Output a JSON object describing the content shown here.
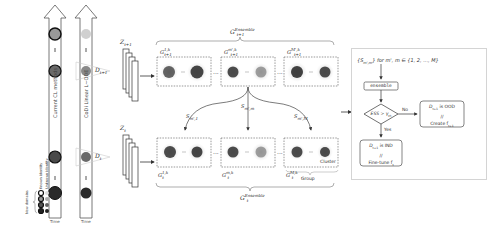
{
  "timeline_left": {
    "label": "Current CL methods",
    "axis_label": "Time",
    "dots": [
      "...",
      "..."
    ]
  },
  "timeline_right": {
    "label": "CoDi Linear L~ODE",
    "axis_label": "Time",
    "dots": [
      "...",
      "..."
    ]
  },
  "legend": {
    "group_label": "New domains",
    "col1": "Known identity",
    "col2": "Unknown identity"
  },
  "data_labels": {
    "d_next": "D",
    "d_next_sub": "t+1",
    "d_curr": "D",
    "d_curr_sub": "t"
  },
  "latent_labels": {
    "z_next": "Z",
    "z_next_sub": "t+1",
    "z_curr": "Z",
    "z_curr_sub": "t"
  },
  "top_ensemble": {
    "title": "G",
    "title_sup": "Ensemble",
    "title_sub": "t+1",
    "groups": [
      {
        "label": "G",
        "sup": "1,k",
        "sub": "t+1"
      },
      {
        "label": "G",
        "sup": "m',k",
        "sub": "t+1"
      },
      {
        "label": "G",
        "sup": "M',k",
        "sub": "t+1"
      }
    ],
    "ellipsis": "..."
  },
  "bottom_ensemble": {
    "title": "G",
    "title_sup": "Ensemble",
    "title_sub": "t",
    "groups": [
      {
        "label": "G",
        "sup": "1,k",
        "sub": "t"
      },
      {
        "label": "G",
        "sup": "m,k",
        "sub": "t"
      },
      {
        "label": "G",
        "sup": "M,k",
        "sub": "t"
      }
    ],
    "cluster_label": "Cluster",
    "group_label": "Group",
    "ellipsis": "..."
  },
  "similarities": [
    {
      "label": "S",
      "sub": "m',1"
    },
    {
      "label": "S",
      "sub": "m',m"
    },
    {
      "label": "S",
      "sub": "m',M"
    }
  ],
  "flowchart": {
    "input": "{S",
    "input_sub": "m',m",
    "input_rest": "} for m', m ∈ {1, 2, ..., M}",
    "ensemble": "ensemble",
    "decision": "ESS > γ",
    "decision_sub": "th",
    "no_label": "No",
    "yes_label": "Yes",
    "ood_line1": "D",
    "ood_line1_sub": "t+1",
    "ood_line1_rest": " is OOD",
    "ood_line2": "//",
    "ood_line3": "Create f",
    "ood_line3_sub": "t+1",
    "ind_line1": "D",
    "ind_line1_sub": "t+1",
    "ind_line1_rest": " is IND",
    "ind_line2": "//",
    "ind_line3": "Fine-tune f",
    "ind_line3_sub": "t"
  },
  "colors": {
    "dark_dot": "#2a2a2a",
    "mid_dot": "#777777",
    "light_dot": "#c8c8c8",
    "cluster_dark": "#3a3a3a",
    "line": "#444444",
    "dashed": "#666666"
  }
}
